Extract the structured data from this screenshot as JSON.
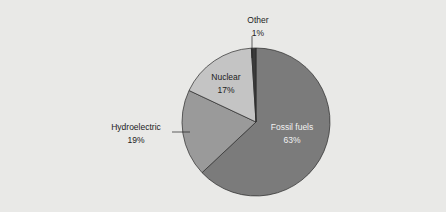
{
  "chart_data": {
    "type": "pie",
    "title": "",
    "slices": [
      {
        "label": "Fossil fuels",
        "value": 63,
        "value_label": "63%",
        "color": "#7b7b7b"
      },
      {
        "label": "Hydroelectric",
        "value": 19,
        "value_label": "19%",
        "color": "#9a9a9a"
      },
      {
        "label": "Nuclear",
        "value": 17,
        "value_label": "17%",
        "color": "#c4c4c4"
      },
      {
        "label": "Other",
        "value": 1,
        "value_label": "1%",
        "color": "#3a3a3a"
      }
    ],
    "background": "#e9e9e7"
  }
}
